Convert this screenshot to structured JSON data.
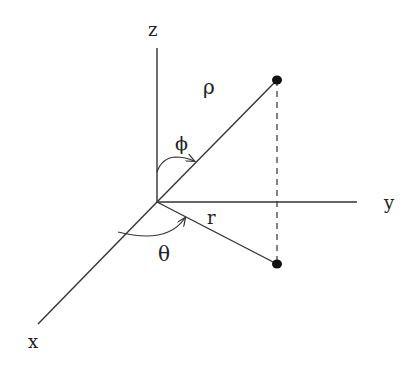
{
  "diagram": {
    "axes": {
      "x": {
        "label": "x"
      },
      "y": {
        "label": "y"
      },
      "z": {
        "label": "z"
      }
    },
    "symbols": {
      "rho": "ρ",
      "phi": "ϕ",
      "r": "r",
      "theta": "θ"
    },
    "colors": {
      "line": "#333333",
      "point": "#111111",
      "background": "#ffffff"
    }
  }
}
